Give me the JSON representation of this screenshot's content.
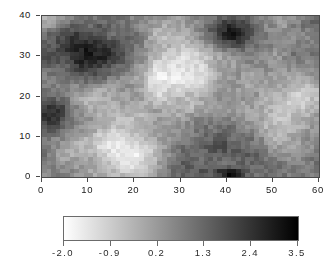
{
  "figure": {
    "background_color": "#ffffff",
    "axis_color": "#4a4a4a",
    "text_color": "#1a1a1a"
  },
  "chart_data": {
    "type": "heatmap",
    "title": "",
    "subtitle": "",
    "xlabel": "",
    "ylabel": "",
    "xlim": [
      0,
      60
    ],
    "ylim": [
      0,
      40
    ],
    "grid": false,
    "nx": 60,
    "ny": 40,
    "xticks": [
      0,
      10,
      20,
      30,
      40,
      50,
      60
    ],
    "xticklabels": [
      "0",
      "10",
      "20",
      "30",
      "40",
      "50",
      "60"
    ],
    "yticks": [
      0,
      10,
      20,
      30,
      40
    ],
    "yticklabels": [
      "0",
      "10",
      "20",
      "30",
      "40"
    ],
    "colormap": "grayscale-reversed",
    "colormap_low_color": "#ffffff",
    "colormap_high_color": "#000000",
    "vmin": -2.0,
    "vmax": 3.5,
    "legend_position": "bottom",
    "colorbar": {
      "orientation": "horizontal",
      "ticks": [
        -2.0,
        -0.9,
        0.2,
        1.3,
        2.4,
        3.5
      ],
      "ticklabels": [
        "-2.0",
        "-0.9",
        "0.2",
        "1.3",
        "2.4",
        "3.5"
      ]
    },
    "field_seed": 20240517,
    "field_features": [
      {
        "name": "dark-patch-upper-left",
        "cx": 11,
        "cy": 31,
        "rx": 9,
        "ry": 8,
        "amp": 2.3
      },
      {
        "name": "dark-patch-left-mid",
        "cx": 2,
        "cy": 16,
        "rx": 5,
        "ry": 4,
        "amp": 2.4
      },
      {
        "name": "dark-patch-upper-right",
        "cx": 42,
        "cy": 36,
        "rx": 5,
        "ry": 4,
        "amp": 2.2
      },
      {
        "name": "dark-streak-lower-mid",
        "cx": 36,
        "cy": 8,
        "rx": 10,
        "ry": 6,
        "amp": 1.8
      },
      {
        "name": "dark-band-bottom",
        "cx": 41,
        "cy": 1,
        "rx": 3,
        "ry": 1,
        "amp": 3.2
      },
      {
        "name": "light-region-lower-left",
        "cx": 17,
        "cy": 7,
        "rx": 12,
        "ry": 6,
        "amp": -2.0
      },
      {
        "name": "light-region-upper-mid",
        "cx": 28,
        "cy": 25,
        "rx": 10,
        "ry": 8,
        "amp": -1.9
      },
      {
        "name": "light-region-right",
        "cx": 52,
        "cy": 19,
        "rx": 9,
        "ry": 9,
        "amp": -1.4
      }
    ]
  }
}
